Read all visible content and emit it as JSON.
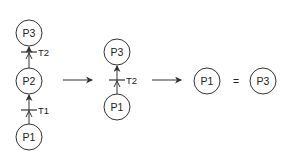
{
  "diagram": {
    "stage1": {
      "places": [
        {
          "id": "P3",
          "label": "P3",
          "cx": 29,
          "cy": 33
        },
        {
          "id": "P2",
          "label": "P2",
          "cx": 29,
          "cy": 81
        },
        {
          "id": "P1",
          "label": "P1",
          "cx": 29,
          "cy": 137
        }
      ],
      "transitions": [
        {
          "id": "T2",
          "label": "T2",
          "y": 52
        },
        {
          "id": "T1",
          "label": "T1",
          "y": 110
        }
      ]
    },
    "stage2": {
      "places": [
        {
          "id": "P3",
          "label": "P3",
          "cx": 117,
          "cy": 52
        },
        {
          "id": "P1",
          "label": "P1",
          "cx": 117,
          "cy": 107
        }
      ],
      "transitions": [
        {
          "id": "T2",
          "label": "T2",
          "y": 80
        }
      ]
    },
    "stage3": {
      "places": [
        {
          "id": "P1",
          "label": "P1",
          "cx": 207,
          "cy": 81
        },
        {
          "id": "P3",
          "label": "P3",
          "cx": 263,
          "cy": 81
        }
      ],
      "equals": "="
    },
    "colors": {
      "stroke": "#333333",
      "background": "#ffffff"
    }
  }
}
